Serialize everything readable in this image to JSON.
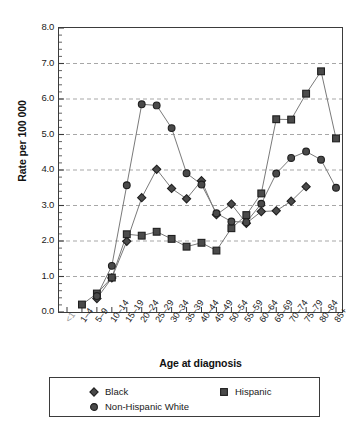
{
  "chart_data": {
    "type": "line",
    "title": "",
    "xlabel": "Age at diagnosis",
    "ylabel": "Rate per 100 000",
    "ylim": [
      0.0,
      8.0
    ],
    "ytick_labels": [
      "0.0",
      "1.0",
      "2.0",
      "3.0",
      "4.0",
      "5.0",
      "6.0",
      "7.0",
      "8.0"
    ],
    "ytick_values": [
      0.0,
      1.0,
      2.0,
      3.0,
      4.0,
      5.0,
      6.0,
      7.0,
      8.0
    ],
    "grid": "horizontal-dashed",
    "minor_ticks": true,
    "legend_position": "below-plot",
    "categories": [
      "<1",
      "1–4",
      "5–9",
      "10–14",
      "15–19",
      "20–24",
      "25–29",
      "30–34",
      "35–39",
      "40–44",
      "45–49",
      "50–54",
      "55–59",
      "60–64",
      "65–69",
      "70–74",
      "75–79",
      "80–84",
      "85+"
    ],
    "series": [
      {
        "name": "Black",
        "marker": "diamond",
        "color": "#3c3c3c",
        "values": [
          null,
          null,
          0.38,
          0.96,
          1.99,
          3.22,
          4.02,
          3.48,
          3.19,
          3.7,
          2.74,
          3.04,
          2.5,
          2.83,
          2.85,
          3.12,
          3.53,
          null,
          null
        ]
      },
      {
        "name": "Hispanic",
        "marker": "square",
        "color": "#4a4a4a",
        "values": [
          null,
          0.21,
          0.52,
          0.97,
          2.19,
          2.15,
          2.26,
          2.06,
          1.84,
          1.95,
          1.73,
          2.36,
          2.73,
          3.34,
          5.43,
          5.42,
          6.15,
          6.78,
          4.89
        ]
      },
      {
        "name": "Non-Hispanic White",
        "marker": "circle",
        "color": "#555555",
        "values": [
          null,
          null,
          0.45,
          1.3,
          3.57,
          5.85,
          5.82,
          5.18,
          3.91,
          3.59,
          2.78,
          2.55,
          2.53,
          3.05,
          3.9,
          4.34,
          4.52,
          4.29,
          3.5
        ]
      }
    ]
  },
  "legend": {
    "entries": [
      {
        "label": "Black",
        "marker": "diamond"
      },
      {
        "label": "Hispanic",
        "marker": "square"
      },
      {
        "label": "Non-Hispanic White",
        "marker": "circle"
      }
    ]
  },
  "axis_titles": {
    "x": "Age at diagnosis",
    "y": "Rate per 100 000"
  },
  "colors": {
    "line": "#7a7a7a",
    "marker_fill": "#4a4a4a",
    "marker_edge": "#1f1f1f",
    "axis": "#3b3b3b",
    "grid": "#9d9d9d",
    "text": "#1a1a1a"
  }
}
